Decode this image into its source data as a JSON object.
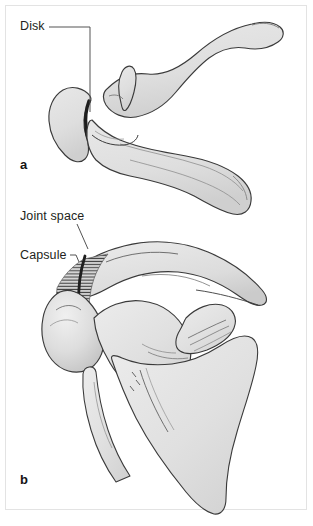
{
  "figure": {
    "type": "anatomical-illustration",
    "background_color": "#ffffff",
    "border_color": "#e3e3e3",
    "bone_fill_color": "#e0e0e0",
    "bone_outline_color": "#3a3a3a",
    "shading_color": "#c9c9c9",
    "text_color": "#231f20",
    "leader_line_color": "#4a4a4a"
  },
  "panels": [
    {
      "letter": "a",
      "view": "superior",
      "labels": [
        {
          "text": "Disk"
        }
      ]
    },
    {
      "letter": "b",
      "view": "anterior",
      "labels": [
        {
          "text": "Joint space"
        },
        {
          "text": "Capsule"
        }
      ]
    }
  ],
  "labels": {
    "disk": "Disk",
    "joint_space": "Joint space",
    "capsule": "Capsule"
  },
  "panel_letters": {
    "a": "a",
    "b": "b"
  }
}
